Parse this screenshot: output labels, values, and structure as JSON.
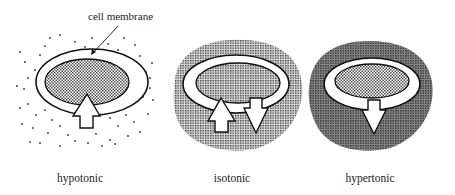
{
  "diagram": {
    "callout": {
      "text": "cell membrane"
    },
    "panels": [
      {
        "id": "hypotonic",
        "label": "hypotonic",
        "outside": "sparse dots (low solute)",
        "inside": "dotted shading",
        "arrows": [
          "inward (up, large)"
        ]
      },
      {
        "id": "isotonic",
        "label": "isotonic",
        "outside": "dense shading (equal solute)",
        "inside": "same shading",
        "arrows": [
          "inward (up)",
          "outward (down)"
        ]
      },
      {
        "id": "hypertonic",
        "label": "hypertonic",
        "outside": "dark dense shading (high solute)",
        "inside": "lighter shading",
        "arrows": [
          "outward (down, large)"
        ]
      }
    ],
    "colors": {
      "line": "#111111",
      "background": "#ffffff",
      "shade_light": "#b5b5b5",
      "shade_dark": "#8a8a8a"
    }
  }
}
